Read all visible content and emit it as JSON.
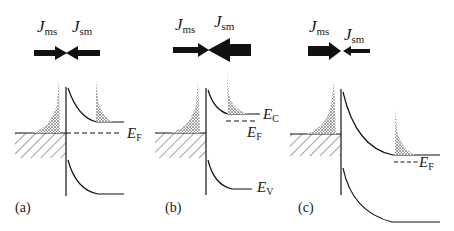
{
  "figure": {
    "colors": {
      "ink": "#1a1a1a",
      "background": "#ffffff"
    }
  },
  "panels": [
    {
      "id": "a",
      "label": "(a)",
      "flux_left": {
        "symbol": "J",
        "subscript": "ms"
      },
      "flux_right": {
        "symbol": "J",
        "subscript": "sm"
      },
      "fermi_label": {
        "symbol": "E",
        "subscript": "F"
      }
    },
    {
      "id": "b",
      "label": "(b)",
      "flux_left": {
        "symbol": "J",
        "subscript": "ms"
      },
      "flux_right": {
        "symbol": "J",
        "subscript": "sm"
      },
      "conduction_label": {
        "symbol": "E",
        "subscript": "C"
      },
      "fermi_label": {
        "symbol": "E",
        "subscript": "F"
      },
      "valence_label": {
        "symbol": "E",
        "subscript": "V"
      }
    },
    {
      "id": "c",
      "label": "(c)",
      "flux_left": {
        "symbol": "J",
        "subscript": "ms"
      },
      "flux_right": {
        "symbol": "J",
        "subscript": "sm"
      },
      "fermi_label": {
        "symbol": "E",
        "subscript": "F"
      }
    }
  ]
}
